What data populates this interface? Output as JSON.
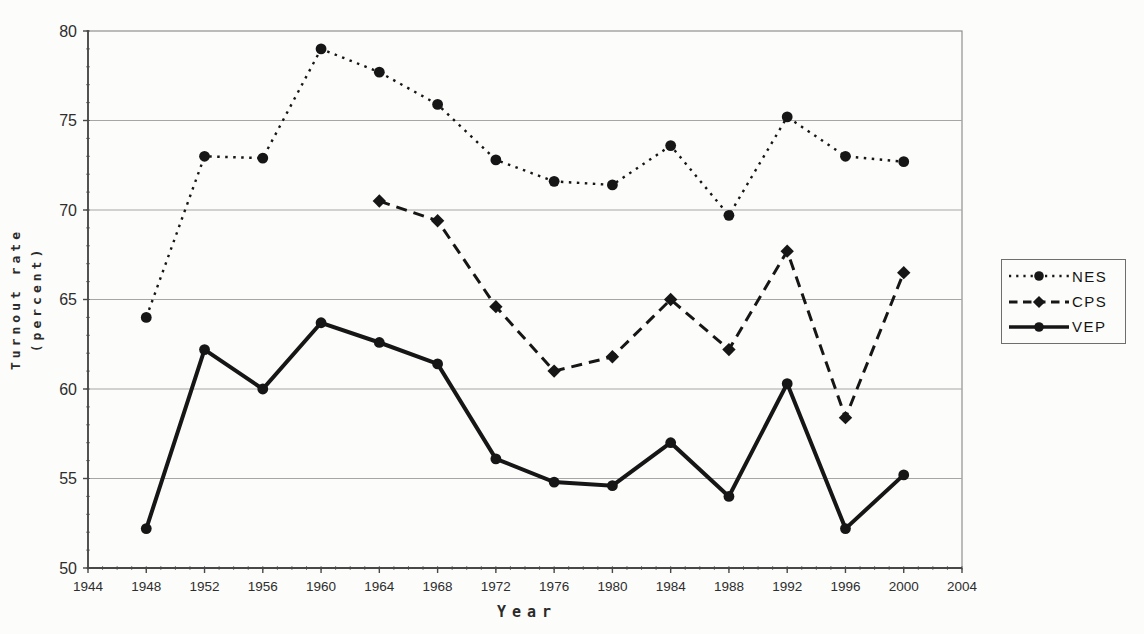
{
  "colors": {
    "data": "#161616",
    "grid": "#a6a6a6",
    "frame": "#909090",
    "axis": "#484848",
    "text": "#2e2e2e",
    "background": "#fcfcfa"
  },
  "chart_data": {
    "type": "line",
    "title": "",
    "xlabel": "Year",
    "ylabel": "Turnout rate (percent)",
    "ylabel_lines": [
      "Turnout rate",
      "(percent)"
    ],
    "xlim": [
      1944,
      2004
    ],
    "ylim": [
      50,
      80
    ],
    "x_ticks": [
      1944,
      1948,
      1952,
      1956,
      1960,
      1964,
      1968,
      1972,
      1976,
      1980,
      1984,
      1988,
      1992,
      1996,
      2000,
      2004
    ],
    "y_ticks": [
      50,
      55,
      60,
      65,
      70,
      75,
      80
    ],
    "grid": "horizontal-major",
    "legend_position": "right-outside",
    "series": [
      {
        "name": "NES",
        "line_style": "dotted",
        "marker": "circle",
        "x": [
          1948,
          1952,
          1956,
          1960,
          1964,
          1968,
          1972,
          1976,
          1980,
          1984,
          1988,
          1992,
          1996,
          2000
        ],
        "values": [
          64.0,
          73.0,
          72.9,
          79.0,
          77.7,
          75.9,
          72.8,
          71.6,
          71.4,
          73.6,
          69.7,
          75.2,
          73.0,
          72.7
        ]
      },
      {
        "name": "CPS",
        "line_style": "dashed",
        "marker": "diamond",
        "x": [
          1964,
          1968,
          1972,
          1976,
          1980,
          1984,
          1988,
          1992,
          1996,
          2000
        ],
        "values": [
          70.5,
          69.4,
          64.6,
          61.0,
          61.8,
          65.0,
          62.2,
          67.7,
          58.4,
          66.5
        ]
      },
      {
        "name": "VEP",
        "line_style": "solid",
        "marker": "circle",
        "x": [
          1948,
          1952,
          1956,
          1960,
          1964,
          1968,
          1972,
          1976,
          1980,
          1984,
          1988,
          1992,
          1996,
          2000
        ],
        "values": [
          52.2,
          62.2,
          60.0,
          63.7,
          62.6,
          61.4,
          56.1,
          54.8,
          54.6,
          57.0,
          54.0,
          60.3,
          52.2,
          55.2
        ]
      }
    ]
  }
}
